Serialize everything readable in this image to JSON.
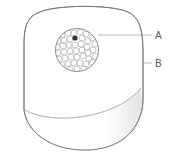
{
  "diagram": {
    "callouts": [
      {
        "label": "A",
        "target": "sensor-lens"
      },
      {
        "label": "B",
        "target": "device-body"
      }
    ]
  },
  "colors": {
    "outline": "#6e6e6e",
    "lens_pattern": "#8a8a8a",
    "indicator_dot": "#333333",
    "base_shade": "#e8e8e8",
    "label": "#555555"
  }
}
